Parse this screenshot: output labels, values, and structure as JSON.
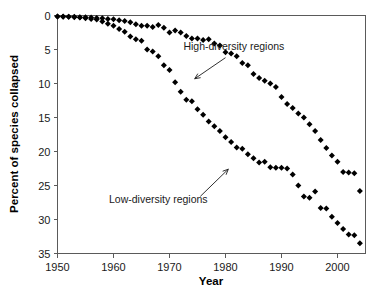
{
  "chart_data": {
    "type": "scatter",
    "title": "",
    "xlabel": "Year",
    "ylabel": "Percent of species collapsed",
    "xlim": [
      1950,
      2005
    ],
    "ylim": [
      0,
      35
    ],
    "y_inverted": true,
    "grid": false,
    "legend_position": "inline-annotations",
    "xticks": [
      1950,
      1960,
      1970,
      1980,
      1990,
      2000
    ],
    "yticks": [
      0,
      5,
      10,
      15,
      20,
      25,
      30,
      35
    ],
    "marker": "diamond",
    "marker_color": "#000000",
    "annotations": [
      {
        "text": "High-diversity regions",
        "text_x": 1981.5,
        "text_y": 5.0,
        "arrow_from_x": 1980.0,
        "arrow_from_y": 6.2,
        "arrow_to_x": 1974.5,
        "arrow_to_y": 9.3
      },
      {
        "text": "Low-diversity regions",
        "text_x": 1968.0,
        "text_y": 27.6,
        "arrow_from_x": 1975.5,
        "arrow_from_y": 26.6,
        "arrow_to_x": 1980.5,
        "arrow_to_y": 22.6
      }
    ],
    "series": [
      {
        "name": "High-diversity regions",
        "points": [
          [
            1950,
            0.15
          ],
          [
            1951,
            0.15
          ],
          [
            1952,
            0.2
          ],
          [
            1953,
            0.2
          ],
          [
            1954,
            0.25
          ],
          [
            1955,
            0.25
          ],
          [
            1956,
            0.3
          ],
          [
            1957,
            0.35
          ],
          [
            1958,
            0.4
          ],
          [
            1959,
            0.5
          ],
          [
            1960,
            0.55
          ],
          [
            1961,
            0.7
          ],
          [
            1962,
            0.8
          ],
          [
            1963,
            1.0
          ],
          [
            1964,
            1.3
          ],
          [
            1965,
            1.5
          ],
          [
            1966,
            1.5
          ],
          [
            1967,
            1.7
          ],
          [
            1968,
            1.4
          ],
          [
            1969,
            1.8
          ],
          [
            1970,
            2.5
          ],
          [
            1971,
            2.2
          ],
          [
            1972,
            2.5
          ],
          [
            1973,
            3.0
          ],
          [
            1974,
            3.4
          ],
          [
            1975,
            3.4
          ],
          [
            1976,
            3.6
          ],
          [
            1977,
            3.5
          ],
          [
            1978,
            4.1
          ],
          [
            1979,
            4.4
          ],
          [
            1980,
            5.4
          ],
          [
            1981,
            5.6
          ],
          [
            1982,
            6.0
          ],
          [
            1983,
            7.0
          ],
          [
            1984,
            7.3
          ],
          [
            1985,
            8.6
          ],
          [
            1986,
            9.2
          ],
          [
            1987,
            9.6
          ],
          [
            1988,
            10.0
          ],
          [
            1989,
            10.5
          ],
          [
            1990,
            12.0
          ],
          [
            1991,
            13.0
          ],
          [
            1992,
            13.6
          ],
          [
            1993,
            14.4
          ],
          [
            1994,
            15.0
          ],
          [
            1995,
            16.0
          ],
          [
            1996,
            17.0
          ],
          [
            1997,
            18.3
          ],
          [
            1998,
            19.5
          ],
          [
            1999,
            20.6
          ],
          [
            2000,
            21.5
          ],
          [
            2001,
            23.0
          ],
          [
            2002,
            23.1
          ],
          [
            2003,
            23.2
          ],
          [
            2004,
            25.8
          ]
        ]
      },
      {
        "name": "Low-diversity regions",
        "points": [
          [
            1950,
            0.15
          ],
          [
            1951,
            0.2
          ],
          [
            1952,
            0.2
          ],
          [
            1953,
            0.25
          ],
          [
            1954,
            0.3
          ],
          [
            1955,
            0.4
          ],
          [
            1956,
            0.5
          ],
          [
            1957,
            0.6
          ],
          [
            1958,
            0.9
          ],
          [
            1959,
            1.2
          ],
          [
            1960,
            1.5
          ],
          [
            1961,
            2.0
          ],
          [
            1962,
            2.4
          ],
          [
            1963,
            3.1
          ],
          [
            1964,
            3.5
          ],
          [
            1965,
            3.7
          ],
          [
            1966,
            5.0
          ],
          [
            1967,
            5.3
          ],
          [
            1968,
            6.0
          ],
          [
            1969,
            7.3
          ],
          [
            1970,
            8.0
          ],
          [
            1971,
            9.8
          ],
          [
            1972,
            11.2
          ],
          [
            1973,
            12.4
          ],
          [
            1974,
            12.6
          ],
          [
            1975,
            13.8
          ],
          [
            1976,
            14.6
          ],
          [
            1977,
            15.6
          ],
          [
            1978,
            16.3
          ],
          [
            1979,
            17.0
          ],
          [
            1980,
            17.9
          ],
          [
            1981,
            18.6
          ],
          [
            1982,
            19.4
          ],
          [
            1983,
            19.6
          ],
          [
            1984,
            20.4
          ],
          [
            1985,
            21.0
          ],
          [
            1986,
            21.6
          ],
          [
            1987,
            21.5
          ],
          [
            1988,
            22.3
          ],
          [
            1989,
            22.4
          ],
          [
            1990,
            22.4
          ],
          [
            1991,
            22.5
          ],
          [
            1992,
            23.4
          ],
          [
            1993,
            25.0
          ],
          [
            1994,
            26.6
          ],
          [
            1995,
            26.8
          ],
          [
            1996,
            25.9
          ],
          [
            1997,
            28.3
          ],
          [
            1998,
            28.4
          ],
          [
            1999,
            29.6
          ],
          [
            2000,
            30.5
          ],
          [
            2001,
            31.4
          ],
          [
            2002,
            32.2
          ],
          [
            2003,
            32.3
          ],
          [
            2004,
            33.5
          ]
        ]
      }
    ]
  }
}
